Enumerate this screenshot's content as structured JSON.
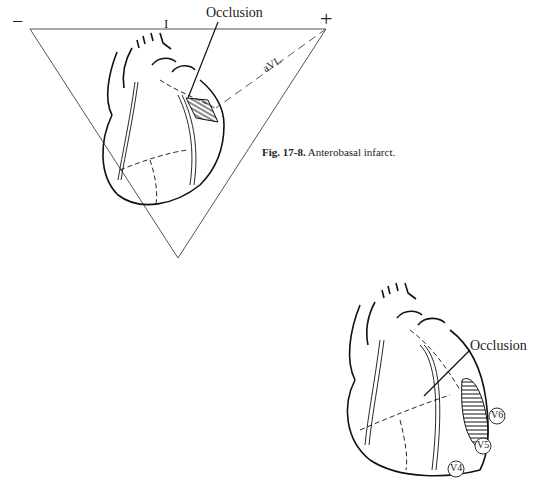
{
  "figure_top": {
    "labels": {
      "minus": "−",
      "plus": "+",
      "lead_I": "I",
      "lead_aVL": "aVL",
      "occlusion": "Occlusion"
    }
  },
  "caption": {
    "number": "Fig. 17-8.",
    "text": "Anterobasal infarct."
  },
  "figure_bottom": {
    "labels": {
      "occlusion": "Occlusion",
      "leads": [
        "V6",
        "V5",
        "V4"
      ]
    }
  },
  "colors": {
    "line": "#111111",
    "background": "#ffffff"
  }
}
